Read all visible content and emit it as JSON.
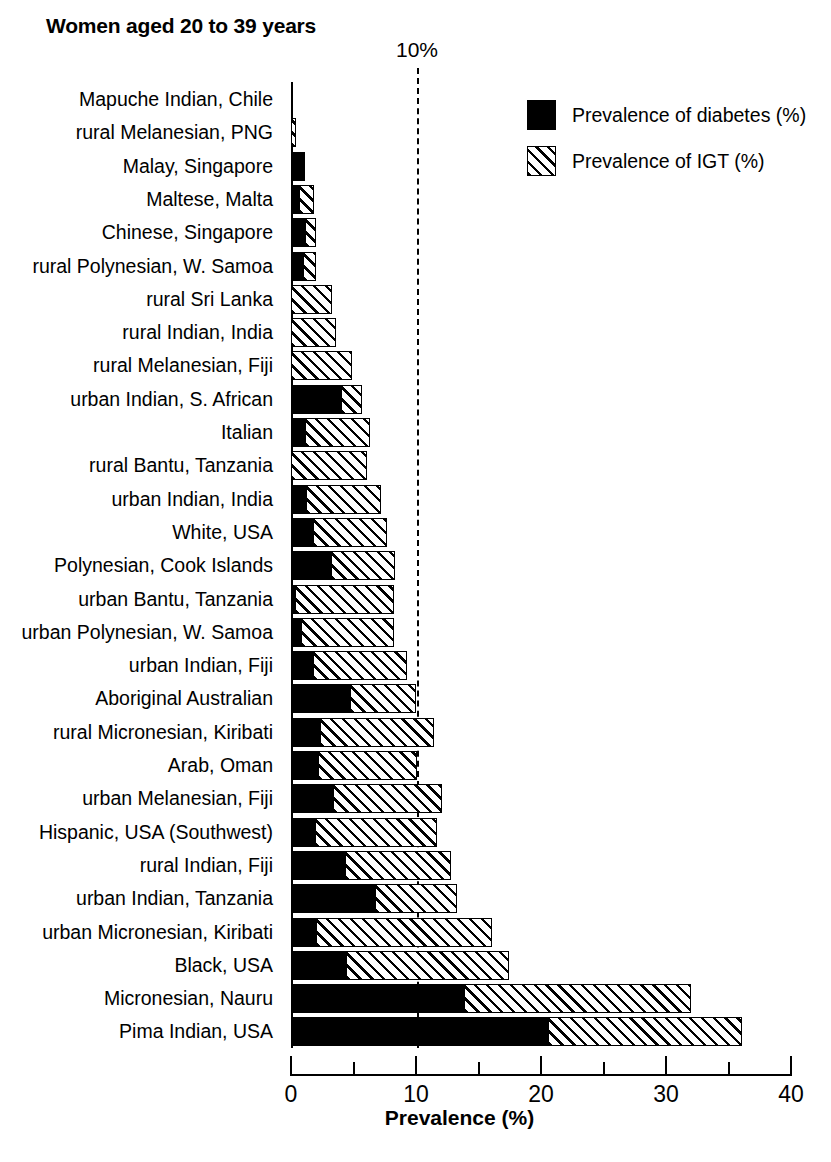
{
  "title": "Women aged 20 to 39 years",
  "annotation": {
    "ten_percent_label": "10%"
  },
  "legend": {
    "items": [
      {
        "key": "diabetes",
        "label": "Prevalence of diabetes (%)",
        "pattern": "solid",
        "color": "#000000"
      },
      {
        "key": "igt",
        "label": "Prevalence of IGT (%)",
        "pattern": "hatch",
        "color": "#000000"
      }
    ]
  },
  "axis": {
    "x_title": "Prevalence (%)",
    "x_ticks": [
      "0",
      "10",
      "20",
      "30",
      "40"
    ],
    "x_tick_values": [
      0,
      10,
      20,
      30,
      40
    ],
    "x_minor_values": [
      5,
      15,
      25,
      35
    ],
    "xlim": [
      0,
      40
    ]
  },
  "chart_data": {
    "type": "bar",
    "orientation": "horizontal",
    "stacked": true,
    "title": "Women aged 20 to 39 years",
    "xlabel": "Prevalence (%)",
    "ylabel": "",
    "xlim": [
      0,
      40
    ],
    "grid": false,
    "legend_position": "top-right",
    "annotations": [
      {
        "text": "10%",
        "type": "vline",
        "x": 10,
        "style": "dashed"
      }
    ],
    "categories": [
      "Mapuche Indian, Chile",
      "rural Melanesian, PNG",
      "Malay, Singapore",
      "Maltese, Malta",
      "Chinese, Singapore",
      "rural Polynesian, W. Samoa",
      "rural Sri Lanka",
      "rural Indian, India",
      "rural Melanesian, Fiji",
      "urban Indian, S. African",
      "Italian",
      "rural Bantu, Tanzania",
      "urban Indian, India",
      "White, USA",
      "Polynesian, Cook Islands",
      "urban Bantu, Tanzania",
      "urban Polynesian, W. Samoa",
      "urban Indian, Fiji",
      "Aboriginal Australian",
      "rural Micronesian, Kiribati",
      "Arab, Oman",
      "urban Melanesian, Fiji",
      "Hispanic, USA (Southwest)",
      "rural Indian, Fiji",
      "urban Indian, Tanzania",
      "urban Micronesian, Kiribati",
      "Black, USA",
      "Micronesian, Nauru",
      "Pima Indian, USA"
    ],
    "series": [
      {
        "name": "Prevalence of diabetes (%)",
        "values": [
          0.0,
          0.0,
          1.1,
          0.7,
          1.2,
          1.0,
          0.0,
          0.0,
          0.0,
          4.1,
          1.2,
          0.0,
          1.3,
          1.8,
          3.3,
          0.4,
          0.9,
          1.8,
          4.8,
          2.4,
          2.2,
          3.4,
          2.0,
          4.4,
          6.8,
          2.1,
          4.5,
          13.9,
          20.6
        ]
      },
      {
        "name": "Prevalence of IGT (%)",
        "values": [
          0.0,
          0.4,
          0.0,
          1.1,
          0.8,
          1.0,
          3.3,
          3.6,
          4.9,
          1.6,
          5.1,
          6.1,
          5.9,
          5.9,
          5.0,
          7.8,
          7.3,
          7.5,
          5.2,
          9.0,
          7.9,
          8.7,
          9.7,
          8.4,
          6.5,
          14.0,
          12.9,
          18.1,
          15.5
        ]
      }
    ],
    "totals": [
      0.0,
      0.4,
      1.1,
      1.8,
      2.0,
      2.0,
      3.3,
      3.6,
      4.9,
      5.7,
      6.3,
      6.1,
      7.2,
      7.7,
      8.3,
      8.2,
      8.2,
      9.3,
      10.0,
      11.4,
      10.1,
      12.1,
      11.7,
      12.8,
      13.3,
      16.1,
      17.4,
      32.0,
      36.1
    ]
  }
}
